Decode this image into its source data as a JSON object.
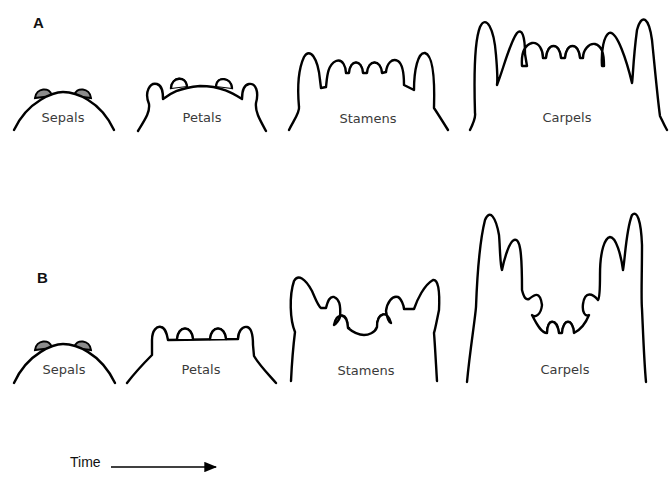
{
  "figure": {
    "panels": [
      {
        "id": "A",
        "label": "A",
        "stages": [
          {
            "name": "Sepals"
          },
          {
            "name": "Petals"
          },
          {
            "name": "Stamens"
          },
          {
            "name": "Carpels"
          }
        ]
      },
      {
        "id": "B",
        "label": "B",
        "stages": [
          {
            "name": "Sepals"
          },
          {
            "name": "Petals"
          },
          {
            "name": "Stamens"
          },
          {
            "name": "Carpels"
          }
        ]
      }
    ],
    "time_axis": {
      "label": "Time",
      "direction": "right-arrow"
    },
    "colors": {
      "outline": "#000000",
      "primordium_fill": "#8c8c8c",
      "background": "#ffffff"
    }
  }
}
